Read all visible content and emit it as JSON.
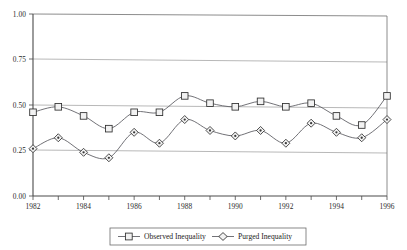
{
  "chart_data": {
    "type": "line",
    "title": "",
    "subtitle": "",
    "xlabel": "",
    "ylabel": "",
    "x": [
      1982,
      1983,
      1984,
      1985,
      1986,
      1987,
      1988,
      1989,
      1990,
      1991,
      1992,
      1993,
      1994,
      1995,
      1996
    ],
    "categories": [
      "1982",
      "1983",
      "1984",
      "1985",
      "1986",
      "1987",
      "1988",
      "1989",
      "1990",
      "1991",
      "1992",
      "1993",
      "1994",
      "1995",
      "1996"
    ],
    "series": [
      {
        "name": "Observed Inequality",
        "marker": "square",
        "values": [
          0.46,
          0.49,
          0.44,
          0.37,
          0.46,
          0.46,
          0.55,
          0.51,
          0.49,
          0.52,
          0.49,
          0.51,
          0.44,
          0.39,
          0.55
        ]
      },
      {
        "name": "Purged Inequality",
        "marker": "diamond",
        "values": [
          0.26,
          0.32,
          0.24,
          0.21,
          0.35,
          0.29,
          0.42,
          0.36,
          0.33,
          0.36,
          0.29,
          0.4,
          0.35,
          0.32,
          0.42
        ]
      }
    ],
    "xlim": [
      1982,
      1996
    ],
    "ylim": [
      0.0,
      1.0
    ],
    "ytick_values": [
      0.0,
      0.25,
      0.5,
      0.75,
      1.0
    ],
    "ytick_labels": [
      "0.00",
      "0.25",
      "0.50",
      "0.75",
      "1.00"
    ],
    "xtick_values": [
      1982,
      1984,
      1986,
      1988,
      1990,
      1992,
      1994,
      1996
    ],
    "xtick_labels": [
      "1982",
      "1984",
      "1986",
      "1988",
      "1990",
      "1992",
      "1994",
      "1996"
    ],
    "xtick_minor_values": [
      1983,
      1985,
      1987,
      1989,
      1991,
      1993,
      1995
    ],
    "grid": true,
    "grid_axis": "y",
    "legend_position": "bottom",
    "colors": {
      "line": "#59595e",
      "marker_fill": "#f2f2f2",
      "marker_stroke": "#2e2e2e",
      "gridline": "#9a9a9a",
      "axis": "#4a4a4a",
      "text": "#2b2b2b",
      "background": "#ffffff"
    }
  },
  "axis": {
    "y_labels": [
      "1.00",
      "0.75",
      "0.50",
      "0.25",
      "0.00"
    ],
    "x_labels": [
      "1982",
      "1984",
      "1986",
      "1988",
      "1990",
      "1992",
      "1994",
      "1996"
    ]
  },
  "legend": {
    "items": [
      {
        "label": "Observed Inequality",
        "marker": "square-marker"
      },
      {
        "label": "Purged Inequality",
        "marker": "diamond-marker"
      }
    ]
  }
}
